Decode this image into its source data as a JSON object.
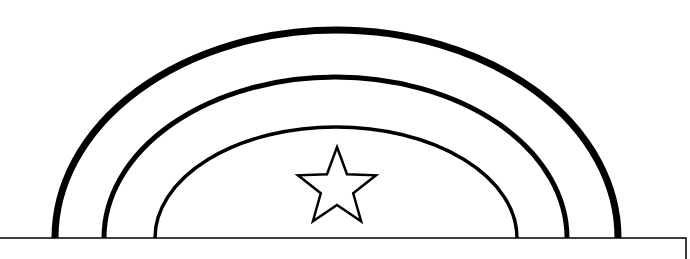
{
  "image": {
    "title": "Rainbow with star coloring page",
    "background_color": "#ffffff",
    "stroke_color": "#000000"
  },
  "drawing": {
    "baseline": {
      "y": 238,
      "x_start": 0,
      "x_end": 686,
      "right_edge_drop_to": 259,
      "stroke_width": 1.5
    },
    "arcs": [
      {
        "name": "outer-arc",
        "left_x": 55,
        "right_x": 618,
        "top_y": 30,
        "base_y": 238,
        "stroke_width": 7
      },
      {
        "name": "middle-arc",
        "left_x": 104,
        "right_x": 567,
        "top_y": 77,
        "base_y": 238,
        "stroke_width": 5
      },
      {
        "name": "inner-arc",
        "left_x": 155,
        "right_x": 517,
        "top_y": 127,
        "base_y": 238,
        "stroke_width": 3.5
      }
    ],
    "star": {
      "center_x": 337,
      "center_y": 188,
      "outer_radius": 41,
      "inner_radius": 17,
      "stroke_width": 2.5,
      "fill": "#ffffff"
    }
  }
}
